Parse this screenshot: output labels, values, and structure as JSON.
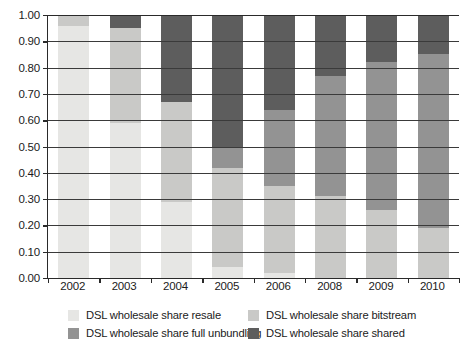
{
  "chart_data": {
    "type": "bar",
    "stacked": true,
    "title": "",
    "xlabel": "",
    "ylabel": "",
    "ylim": [
      0.0,
      1.0
    ],
    "ytick_labels": [
      "0.00",
      "0.10",
      "0.20",
      "0.30",
      "0.40",
      "0.50",
      "0.60",
      "0.70",
      "0.80",
      "0.90",
      "1.00"
    ],
    "ytick_values": [
      0.0,
      0.1,
      0.2,
      0.3,
      0.4,
      0.5,
      0.6,
      0.7,
      0.8,
      0.9,
      1.0
    ],
    "grid": true,
    "grid_axis": "y",
    "legend_position": "bottom",
    "categories": [
      "2002",
      "2003",
      "2004",
      "2005",
      "2006",
      "2008",
      "2009",
      "2010"
    ],
    "series": [
      {
        "name": "DSL wholesale share resale",
        "color": "#e6e6e4",
        "values": [
          0.96,
          0.59,
          0.29,
          0.04,
          0.02,
          0.0,
          0.0,
          0.0
        ]
      },
      {
        "name": "DSL wholesale share bitstream",
        "color": "#c9c9c7",
        "values": [
          0.04,
          0.36,
          0.38,
          0.38,
          0.33,
          0.31,
          0.26,
          0.19
        ]
      },
      {
        "name": "DSL wholesale share full unbundling",
        "color": "#939393",
        "values": [
          0.0,
          0.0,
          0.0,
          0.08,
          0.29,
          0.46,
          0.56,
          0.66
        ]
      },
      {
        "name": "DSL wholesale share shared",
        "color": "#5d5d5d",
        "values": [
          0.0,
          0.05,
          0.33,
          0.5,
          0.36,
          0.23,
          0.18,
          0.15
        ]
      }
    ]
  },
  "legend": {
    "items": [
      {
        "label": "DSL wholesale share resale",
        "color": "#e6e6e4"
      },
      {
        "label": "DSL wholesale share bitstream",
        "color": "#c9c9c7"
      },
      {
        "label": "DSL wholesale share full unbundling",
        "color": "#939393"
      },
      {
        "label": "DSL wholesale share shared",
        "color": "#5d5d5d"
      }
    ]
  }
}
